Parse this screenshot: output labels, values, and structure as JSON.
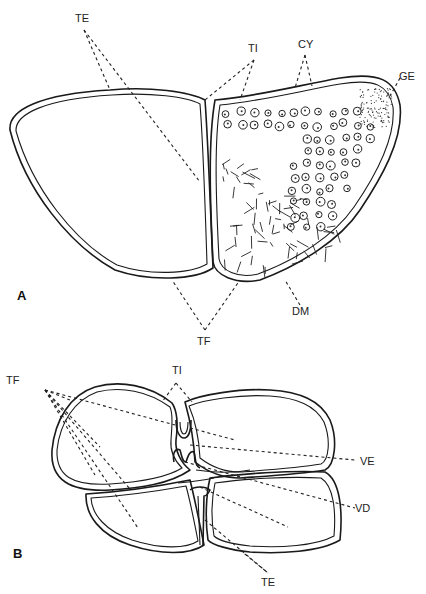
{
  "figure": {
    "panels": [
      {
        "id": "A",
        "label": "A",
        "labels": {
          "te": "TE",
          "ti": "TI",
          "cy": "CY",
          "ge": "GE",
          "dm": "DM",
          "tf": "TF"
        }
      },
      {
        "id": "B",
        "label": "B",
        "labels": {
          "tf": "TF",
          "ti": "TI",
          "ve": "VE",
          "vd": "VD",
          "te": "TE"
        }
      }
    ]
  }
}
